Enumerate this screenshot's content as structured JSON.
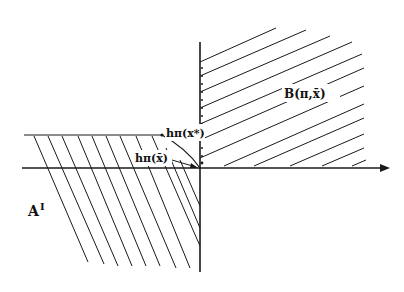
{
  "diagram": {
    "labels": {
      "region_b": "B(π,x̄)",
      "region_a": "A",
      "region_a_prime": "I",
      "h_x_star": "hπ(x*)",
      "h_x_bar": "hπ(x̄)"
    },
    "axes": {
      "origin": [
        200,
        168
      ],
      "x_axis_end": [
        390,
        168
      ],
      "y_axis_top": 42,
      "y_axis_bottom": 272
    },
    "colors": {
      "line": "#1a1a1a",
      "background": "#ffffff"
    }
  }
}
